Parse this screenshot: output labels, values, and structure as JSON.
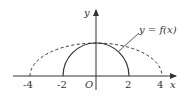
{
  "figure": {
    "axes": {
      "x_label": "x",
      "y_label": "y",
      "origin_label": "O"
    },
    "x_ticks": [
      {
        "label": "-4",
        "value": -4
      },
      {
        "label": "-2",
        "value": -2
      },
      {
        "label": "2",
        "value": 2
      },
      {
        "label": "4",
        "value": 4
      }
    ],
    "curve_label": "y = f(x)",
    "curves": [
      {
        "name": "f(x)",
        "style": "solid",
        "shape": "semicircle",
        "x_range": [
          -2,
          2
        ],
        "peak": 2
      },
      {
        "name": "transformed",
        "style": "dashed",
        "shape": "semi-ellipse",
        "x_range": [
          -4,
          4
        ],
        "peak": 2
      }
    ],
    "colors": {
      "stroke": "#333333",
      "background": "#ffffff"
    }
  }
}
